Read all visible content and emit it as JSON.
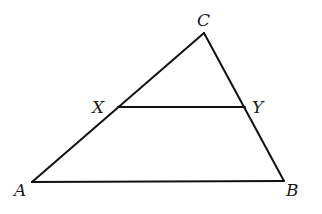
{
  "diagram": {
    "type": "triangle-with-segment",
    "vertices": {
      "A": {
        "label": "A",
        "x": 32,
        "y": 182
      },
      "B": {
        "label": "B",
        "x": 284,
        "y": 181
      },
      "C": {
        "label": "C",
        "x": 204,
        "y": 33
      },
      "X": {
        "label": "X",
        "x": 118,
        "y": 107
      },
      "Y": {
        "label": "Y",
        "x": 245,
        "y": 107
      }
    },
    "segments": [
      "AB",
      "BC",
      "CA",
      "XY"
    ],
    "labels": {
      "A": "A",
      "B": "B",
      "C": "C",
      "X": "X",
      "Y": "Y"
    },
    "colors": {
      "stroke": "#111111",
      "background": "#ffffff"
    }
  }
}
